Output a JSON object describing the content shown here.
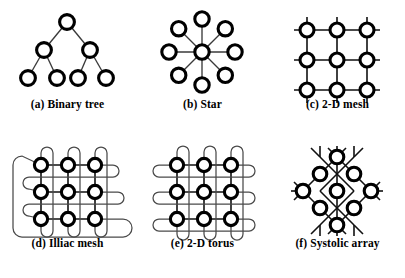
{
  "figure": {
    "background_color": "#ffffff",
    "node_fill": "#ffffff",
    "node_stroke": "#000000",
    "link_color": "#3a3a3a",
    "panel_count": 6
  },
  "panels": [
    {
      "id": "binary-tree",
      "caption": "(a) Binary tree",
      "topology": "binary tree",
      "node_count": 7,
      "levels": 3,
      "nodes": [
        {
          "id": "root",
          "x": 67,
          "y": 22
        },
        {
          "id": "l1",
          "x": 44,
          "y": 50
        },
        {
          "id": "r1",
          "x": 90,
          "y": 50
        },
        {
          "id": "l2a",
          "x": 28,
          "y": 78
        },
        {
          "id": "l2b",
          "x": 57,
          "y": 78
        },
        {
          "id": "r2a",
          "x": 78,
          "y": 78
        },
        {
          "id": "r2b",
          "x": 106,
          "y": 78
        }
      ],
      "edges": [
        [
          "root",
          "l1"
        ],
        [
          "root",
          "r1"
        ],
        [
          "l1",
          "l2a"
        ],
        [
          "l1",
          "l2b"
        ],
        [
          "r1",
          "r2a"
        ],
        [
          "r1",
          "r2b"
        ]
      ]
    },
    {
      "id": "star",
      "caption": "(b) Star",
      "topology": "star",
      "node_count": 9,
      "spoke_count": 8,
      "center": {
        "x": 67,
        "y": 52
      },
      "radius": 33,
      "spoke_angles_deg": [
        270,
        315,
        0,
        45,
        90,
        135,
        180,
        225
      ]
    },
    {
      "id": "mesh-2d",
      "caption": "(c) 2-D mesh",
      "topology": "2-D mesh",
      "node_count": 9,
      "grid": {
        "rows": 3,
        "cols": 3
      },
      "origin": {
        "x": 37,
        "y": 25
      },
      "spacing": 30,
      "stub_length": 13
    },
    {
      "id": "illiac-mesh",
      "caption": "(d) Illiac mesh",
      "topology": "Illiac mesh",
      "node_count": 9,
      "grid": {
        "rows": 3,
        "cols": 3
      },
      "origin": {
        "x": 41,
        "y": 26
      },
      "spacing": 27,
      "wraparound": "column U-loops plus skewed row loops and one outer return loop"
    },
    {
      "id": "torus-2d",
      "caption": "(e) 2-D torus",
      "topology": "2-D torus",
      "node_count": 9,
      "grid": {
        "rows": 3,
        "cols": 3
      },
      "origin": {
        "x": 42,
        "y": 26
      },
      "spacing": 27,
      "wraparound": "each row and each column closes with a loop"
    },
    {
      "id": "systolic-array",
      "caption": "(f) Systolic array",
      "topology": "systolic array",
      "node_count": 9,
      "grid": {
        "rows": 3,
        "cols": 3
      },
      "rotation_deg": 45,
      "center": {
        "x": 67,
        "y": 52
      },
      "spacing": 24,
      "stub_length": 12
    }
  ]
}
